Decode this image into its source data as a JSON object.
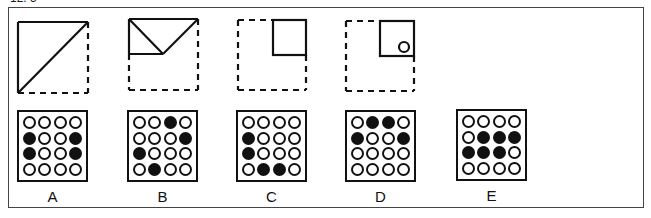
{
  "header": {
    "cut_text": "12. 5"
  },
  "sequence": [
    {
      "id": "figure-1",
      "description": "square with dashed right/bottom, diagonal from bottom-left to top-right"
    },
    {
      "id": "figure-2",
      "description": "top half folded, V shape inside upper rectangle"
    },
    {
      "id": "figure-3",
      "description": "small solid square in top-right quadrant of dashed square"
    },
    {
      "id": "figure-4",
      "description": "small solid square in top-right with small circle near its bottom-right"
    }
  ],
  "options": [
    {
      "label": "A",
      "grid": [
        [
          0,
          0,
          0,
          0
        ],
        [
          1,
          0,
          0,
          1
        ],
        [
          1,
          0,
          0,
          1
        ],
        [
          0,
          0,
          0,
          0
        ]
      ]
    },
    {
      "label": "B",
      "grid": [
        [
          0,
          0,
          1,
          0
        ],
        [
          0,
          0,
          0,
          1
        ],
        [
          1,
          0,
          0,
          0
        ],
        [
          0,
          1,
          0,
          0
        ]
      ]
    },
    {
      "label": "C",
      "grid": [
        [
          0,
          0,
          0,
          0
        ],
        [
          1,
          0,
          0,
          0
        ],
        [
          1,
          0,
          0,
          0
        ],
        [
          0,
          1,
          1,
          0
        ]
      ]
    },
    {
      "label": "D",
      "grid": [
        [
          0,
          1,
          1,
          0
        ],
        [
          1,
          0,
          0,
          1
        ],
        [
          0,
          0,
          0,
          0
        ],
        [
          0,
          0,
          0,
          0
        ]
      ]
    },
    {
      "label": "E",
      "grid": [
        [
          0,
          0,
          0,
          0
        ],
        [
          0,
          1,
          1,
          1
        ],
        [
          1,
          1,
          1,
          0
        ],
        [
          0,
          0,
          0,
          0
        ]
      ]
    }
  ],
  "colors": {
    "ink": "#111111",
    "frame": "#444444",
    "background": "#ffffff"
  }
}
